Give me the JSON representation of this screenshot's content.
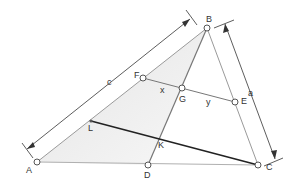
{
  "diagram": {
    "type": "triangle-geometry",
    "points": {
      "A": {
        "label": "A",
        "x": 37,
        "y": 162
      },
      "B": {
        "label": "B",
        "x": 207,
        "y": 28
      },
      "C": {
        "label": "C",
        "x": 258,
        "y": 165
      },
      "D": {
        "label": "D",
        "x": 148,
        "y": 165
      },
      "E": {
        "label": "E",
        "x": 235,
        "y": 102
      },
      "F": {
        "label": "F",
        "x": 143,
        "y": 78
      },
      "G": {
        "label": "G",
        "x": 182,
        "y": 88
      },
      "K": {
        "label": "K",
        "x": 160,
        "y": 140
      },
      "L": {
        "label": "L",
        "x": 91,
        "y": 121
      }
    },
    "segment_labels": {
      "c": "c",
      "a": "a",
      "x": "x",
      "y": "y"
    },
    "colors": {
      "shade": "#e8e8e8",
      "line": "#8a8a8a",
      "bold_line": "#222222",
      "dim_line": "#333333",
      "point": "#555555"
    }
  }
}
